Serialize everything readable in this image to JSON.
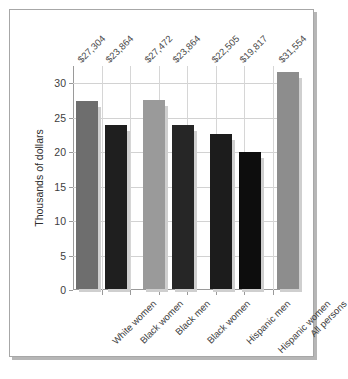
{
  "chart_data": {
    "type": "bar",
    "title": "",
    "subtitle": "",
    "xlabel": "",
    "ylabel": "Thousands of dollars",
    "ylim": [
      0,
      32.5
    ],
    "yticks": [
      0,
      5,
      10,
      15,
      20,
      25,
      30
    ],
    "ytick_labels": [
      "0",
      "5",
      "10",
      "15",
      "20",
      "25",
      "30"
    ],
    "grid": "horizontal-and-vertical",
    "legend": "none",
    "units": "thousands of dollars",
    "categories": [
      "White women",
      "Black women",
      "Black men",
      "Black women",
      "Hispanic men",
      "Hispanic women",
      "All persons"
    ],
    "values": [
      27.304,
      23.864,
      27.472,
      23.864,
      22.505,
      19.817,
      31.554
    ],
    "data_labels": [
      "$27,304",
      "$23,864",
      "$27,472",
      "$23,864",
      "$22,505",
      "$19,817",
      "$31,554"
    ],
    "bar_colors": [
      "#6e6e6e",
      "#1f1f1f",
      "#9a9a9a",
      "#262626",
      "#1c1c1c",
      "#0d0d0d",
      "#8d8d8d"
    ],
    "groups": [
      {
        "label": "White women / Black women",
        "bars": [
          0,
          1
        ]
      },
      {
        "label": "Black men / Black women",
        "bars": [
          2,
          3
        ]
      },
      {
        "label": "Hispanic men / Hispanic women",
        "bars": [
          4,
          5
        ]
      },
      {
        "label": "All persons",
        "bars": [
          6
        ]
      }
    ]
  },
  "frame": {
    "border_color": "#a7a7a7",
    "shadow_color": "#b6b6b6",
    "background": "#ffffff"
  }
}
